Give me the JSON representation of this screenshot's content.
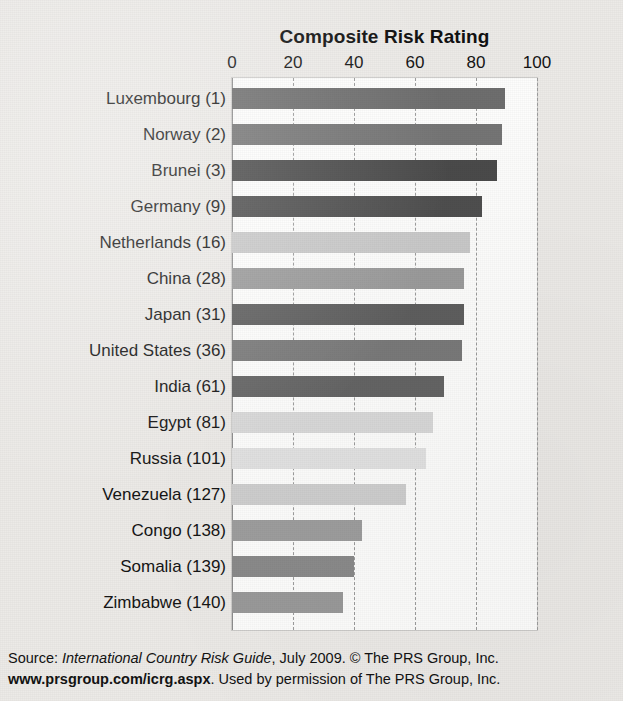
{
  "chart_data": {
    "type": "bar",
    "orientation": "horizontal",
    "title": "Composite Risk Rating",
    "xlabel": "",
    "ylabel": "",
    "xlim": [
      0,
      100
    ],
    "xticks": [
      0,
      20,
      40,
      60,
      80,
      100
    ],
    "xtick_labels": [
      "0",
      "20",
      "40",
      "60",
      "80",
      "100"
    ],
    "grid": true,
    "grid_axis": "x",
    "legend": false,
    "categories": [
      "Luxembourg (1)",
      "Norway (2)",
      "Brunei (3)",
      "Germany (9)",
      "Netherlands (16)",
      "China (28)",
      "Japan (31)",
      "United States (36)",
      "India (61)",
      "Egypt (81)",
      "Russia (101)",
      "Venezuela (127)",
      "Congo (138)",
      "Somalia (139)",
      "Zimbabwe (140)"
    ],
    "values": [
      89.5,
      88.5,
      87,
      82,
      78,
      76,
      76,
      75.5,
      69.5,
      66,
      63.5,
      57,
      42.5,
      40,
      36.5
    ],
    "bar_colors": [
      "#6e6e6e",
      "#757575",
      "#4b4b4b",
      "#4f4f4f",
      "#c9c9c9",
      "#9b9b9b",
      "#5f5f5f",
      "#7a7a7a",
      "#656565",
      "#d9d9d9",
      "#e2e2e2",
      "#cfcfcf",
      "#9e9e9e",
      "#8b8b8b",
      "#9a9a9a"
    ]
  },
  "footer": {
    "line1_prefix": "Source: ",
    "line1_italic": "International Country Risk Guide",
    "line1_suffix": ", July 2009. © The PRS Group, Inc.",
    "line2_bold": "www.prsgroup.com/icrg.aspx",
    "line2_suffix": ". Used by permission of The PRS Group, Inc."
  }
}
